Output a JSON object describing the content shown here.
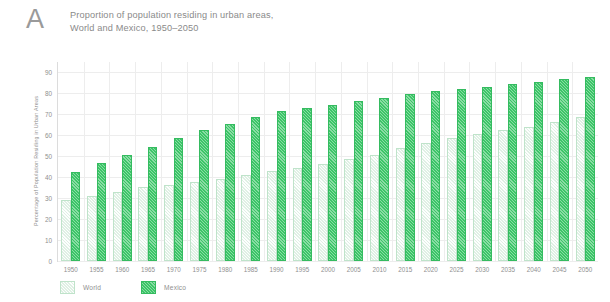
{
  "panel": {
    "letter": "A"
  },
  "title": {
    "line1": "Proportion of population residing in urban areas,",
    "line2": "World and Mexico, 1950–2050"
  },
  "colors": {
    "world": "#dff0e4",
    "world_edge": "#bfe3ca",
    "mexico": "#3cc568",
    "mexico_edge": "#35bb60",
    "grid": "#ededed",
    "axis": "#dcdcdc",
    "text": "#8f8f8f"
  },
  "legend": {
    "position": "bottom-left",
    "items": [
      {
        "label": "World",
        "key": "world"
      },
      {
        "label": "Mexico",
        "key": "mexico"
      }
    ]
  },
  "chart_data": {
    "type": "bar",
    "title": "Proportion of population residing in urban areas, World and Mexico, 1950–2050",
    "xlabel": "",
    "ylabel": "Percentage of Population Residing in Urban Areas",
    "ylim": [
      0,
      95
    ],
    "yticks": [
      0,
      10,
      20,
      30,
      40,
      50,
      60,
      70,
      80,
      90
    ],
    "ytick_labels": [
      "0",
      "10",
      "20",
      "30",
      "40",
      "50",
      "60",
      "70",
      "80",
      "90"
    ],
    "grid": true,
    "categories": [
      "1950",
      "1955",
      "1960",
      "1965",
      "1970",
      "1975",
      "1980",
      "1985",
      "1990",
      "1995",
      "2000",
      "2005",
      "2010",
      "2015",
      "2020",
      "2025",
      "2030",
      "2035",
      "2040",
      "2045",
      "2050"
    ],
    "series": [
      {
        "name": "World",
        "values": [
          29.0,
          30.8,
          33.0,
          35.2,
          36.4,
          37.5,
          39.3,
          41.0,
          42.8,
          44.6,
          46.5,
          48.6,
          50.6,
          53.9,
          56.2,
          58.9,
          60.4,
          62.4,
          64.1,
          66.4,
          68.7
        ]
      },
      {
        "name": "Mexico",
        "values": [
          42.7,
          46.7,
          50.7,
          54.6,
          58.7,
          62.4,
          65.5,
          68.6,
          71.4,
          73.0,
          74.7,
          76.5,
          78.0,
          79.5,
          81.0,
          82.1,
          83.3,
          84.5,
          85.6,
          86.8,
          88.0
        ]
      }
    ]
  }
}
